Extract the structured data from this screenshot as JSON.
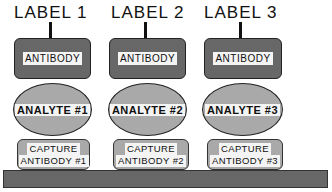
{
  "diagram": {
    "type": "sandwich-immunoassay",
    "columns": [
      {
        "label": "LABEL 1",
        "antibody": "ANTIBODY",
        "analyte": "ANALYTE #1",
        "capture_line1": "CAPTURE",
        "capture_line2": "ANTIBODY #1"
      },
      {
        "label": "LABEL 2",
        "antibody": "ANTIBODY",
        "analyte": "ANALYTE #2",
        "capture_line1": "CAPTURE",
        "capture_line2": "ANTIBODY #2"
      },
      {
        "label": "LABEL 3",
        "antibody": "ANTIBODY",
        "analyte": "ANALYTE #3",
        "capture_line1": "CAPTURE",
        "capture_line2": "ANTIBODY #3"
      }
    ],
    "substrate": "",
    "colors": {
      "line": "#111111",
      "fill_dark": "#b8b8b8",
      "fill_light": "#e2e2e2"
    }
  }
}
